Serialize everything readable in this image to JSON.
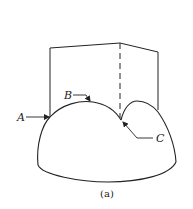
{
  "figure": {
    "caption": "(a)",
    "labels": {
      "A": "A",
      "B": "B",
      "C": "C"
    },
    "colors": {
      "stroke": "#222222",
      "background": "#ffffff"
    }
  }
}
